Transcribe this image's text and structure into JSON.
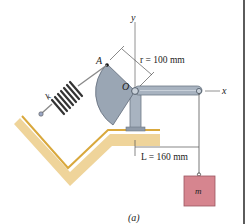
{
  "figure": {
    "caption": "(a)",
    "labels": {
      "y_axis": "y",
      "x_axis": "x",
      "point_A": "A",
      "point_O": "O",
      "spring": "k",
      "mass": "m"
    },
    "dimensions": {
      "radius": "r = 100 mm",
      "length": "L = 160 mm"
    },
    "colors": {
      "cam": "#9aa6b4",
      "arm": "#a8b3c0",
      "ground": "#e7c27a",
      "ground_edge": "#d9a83c",
      "mass": "#d6858f",
      "spring": "#3a3a3a",
      "border": "#333333"
    }
  }
}
